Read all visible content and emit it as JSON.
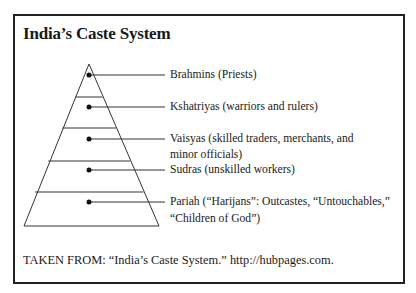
{
  "title": "India’s Caste System",
  "diagram": {
    "type": "pyramid",
    "levels": [
      {
        "name": "Brahmins",
        "line1": "Brahmins (Priests)",
        "line2": ""
      },
      {
        "name": "Kshatriyas",
        "line1": "Kshatriyas (warriors and rulers)",
        "line2": ""
      },
      {
        "name": "Vaisyas",
        "line1": "Vaisyas (skilled traders, merchants, and",
        "line2": "minor officials)"
      },
      {
        "name": "Sudras",
        "line1": "Sudras (unskilled workers)",
        "line2": ""
      },
      {
        "name": "Pariah",
        "line1": "Pariah (“Harijans”: Outcastes, “Untouchables,”",
        "line2": "“Children of God”)"
      }
    ]
  },
  "source": "TAKEN FROM: “India’s Caste System.” http://hubpages.com.",
  "colors": {
    "line": "#222222",
    "background": "#ffffff"
  }
}
